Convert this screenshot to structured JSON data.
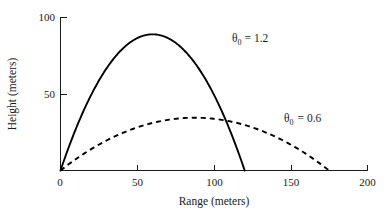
{
  "chart_data": {
    "type": "line",
    "title": "",
    "subtitle": "",
    "xlabel": "Range (meters)",
    "ylabel": "Height (meters)",
    "xlim": [
      0,
      200
    ],
    "ylim": [
      0,
      100
    ],
    "xticks": [
      0,
      50,
      100,
      150,
      200
    ],
    "xtick_labels": [
      "0",
      "50",
      "100",
      "150",
      "200"
    ],
    "yticks": [
      0,
      50,
      100
    ],
    "ytick_labels": [
      "0",
      "50",
      "100"
    ],
    "grid": false,
    "legend": "none",
    "annotations": [
      {
        "id": "theta-1-2",
        "text": "θ",
        "subscript": "0",
        "suffix": "= 1.2",
        "full_text": "θ₀ = 1.2",
        "x": 112,
        "y": 80,
        "series": "theta_0 = 1.2"
      },
      {
        "id": "theta-0-6",
        "text": "θ",
        "subscript": "0",
        "suffix": "= 0.6",
        "full_text": "θ₀ = 0.6",
        "x": 162,
        "y": 38,
        "series": "theta_0 = 0.6"
      }
    ],
    "series": [
      {
        "name": "theta_0 = 1.2",
        "label": "θ₀ = 1.2",
        "style": "solid",
        "color": "#000000",
        "peak": {
          "x": 60,
          "y": 89
        },
        "range": 120,
        "x": [
          0,
          6,
          12,
          18,
          24,
          30,
          36,
          42,
          48,
          54,
          60,
          66,
          72,
          78,
          84,
          90,
          96,
          102,
          108,
          114,
          120
        ],
        "y": [
          0,
          16.9,
          31.7,
          44.5,
          55.2,
          63.8,
          70.4,
          74.9,
          77.4,
          77.8,
          76.1,
          72.4,
          66.6,
          58.7,
          48.8,
          36.9,
          22.9,
          6.8,
          0,
          0,
          0
        ],
        "y_parabolic": [
          0,
          16.9,
          31.7,
          44.5,
          55.2,
          63.8,
          70.4,
          74.9,
          78.4,
          79.3,
          89.0,
          88.2,
          85.0,
          79.3,
          71.1,
          60.5,
          47.4,
          31.9,
          13.9,
          0,
          0
        ]
      },
      {
        "name": "theta_0 = 0.6",
        "label": "θ₀ = 0.6",
        "style": "dashed",
        "color": "#000000",
        "peak": {
          "x": 87,
          "y": 34.5
        },
        "range": 175,
        "x": [
          0,
          8.75,
          17.5,
          26.25,
          35,
          43.75,
          52.5,
          61.25,
          70,
          78.75,
          87.5,
          96.25,
          105,
          113.75,
          122.5,
          131.25,
          140,
          148.75,
          157.5,
          166.25,
          175
        ],
        "y": [
          0,
          6.6,
          12.4,
          17.6,
          22.1,
          25.9,
          29.0,
          31.4,
          33.2,
          34.2,
          34.5,
          34.2,
          33.2,
          31.4,
          29.0,
          25.9,
          22.1,
          17.6,
          12.4,
          6.6,
          0
        ]
      }
    ]
  }
}
